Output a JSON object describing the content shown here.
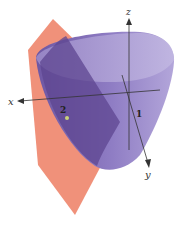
{
  "figure": {
    "axes": {
      "x_label": "x",
      "y_label": "y",
      "z_label": "z"
    },
    "tick_labels": {
      "x_tick": "2",
      "y_tick": "1"
    },
    "colors": {
      "paraboloid_light": "#a898d0",
      "paraboloid_mid": "#8a76bc",
      "paraboloid_dark": "#5e4590",
      "overlap": "#6a4682",
      "plane": "#f0917a",
      "point": "#c9d27a",
      "axis": "#333333"
    }
  }
}
